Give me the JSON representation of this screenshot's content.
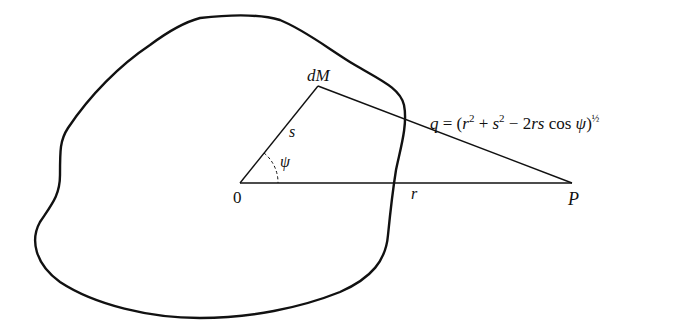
{
  "figure": {
    "points": {
      "origin": {
        "label": "0",
        "x": 240,
        "y": 183
      },
      "mass_element": {
        "label": "dM",
        "x": 318,
        "y": 86
      },
      "external_point": {
        "label": "P",
        "x": 572,
        "y": 183
      }
    },
    "labels": {
      "mass_element": "dM",
      "segment_s": "s",
      "angle": "ψ",
      "origin": "0",
      "segment_r": "r",
      "point": "P"
    },
    "formula": {
      "lhs": "q",
      "equals": " = (",
      "r": "r",
      "r_exp": "2",
      "plus": " + ",
      "s": "s",
      "s_exp": "2",
      "minus": " − 2",
      "rs": "rs",
      "cos": " cos ",
      "psi": "ψ",
      "close": ")",
      "power": "½"
    },
    "colors": {
      "stroke": "#111111",
      "background": "#ffffff"
    }
  }
}
